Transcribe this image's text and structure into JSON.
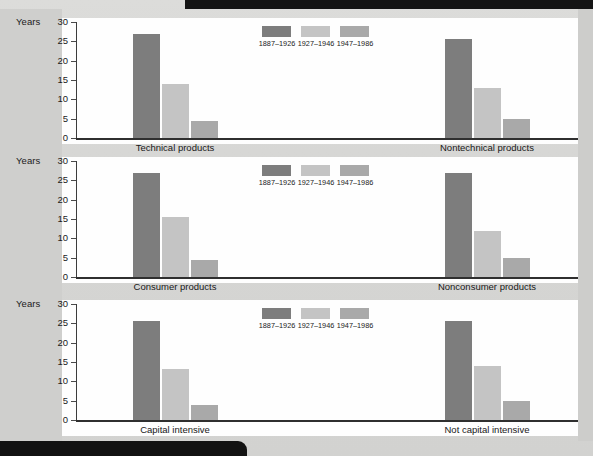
{
  "axis": {
    "y_label": "Years",
    "ticks": [
      "30",
      "25",
      "20",
      "15",
      "10",
      "5",
      "0"
    ],
    "ymin": 0,
    "ymax": 30
  },
  "legend": {
    "items": [
      {
        "label": "1887–1926",
        "color": "#7d7d7d"
      },
      {
        "label": "1927–1946",
        "color": "#c4c4c4"
      },
      {
        "label": "1947–1986",
        "color": "#a9a9a9"
      }
    ]
  },
  "chart_data": {
    "type": "bar",
    "title": "",
    "xlabel": "",
    "ylabel": "Years",
    "ylim": [
      0,
      30
    ],
    "grid": false,
    "legend_position": "top-center",
    "series": [
      {
        "name": "1887–1926",
        "color": "#7d7d7d"
      },
      {
        "name": "1927–1946",
        "color": "#c4c4c4"
      },
      {
        "name": "1947–1986",
        "color": "#a9a9a9"
      }
    ],
    "categories": [
      "Technical products",
      "Nontechnical products",
      "Consumer products",
      "Nonconsumer products",
      "Capital intensive",
      "Not capital intensive"
    ],
    "panels": [
      {
        "index": 0,
        "groups": [
          {
            "label": "Technical products",
            "values": [
              27,
              14,
              4.5
            ]
          },
          {
            "label": "Nontechnical products",
            "values": [
              25.5,
              13,
              5
            ]
          }
        ]
      },
      {
        "index": 1,
        "groups": [
          {
            "label": "Consumer products",
            "values": [
              27,
              15.5,
              4.5
            ]
          },
          {
            "label": "Nonconsumer products",
            "values": [
              27,
              12,
              5
            ]
          }
        ]
      },
      {
        "index": 2,
        "groups": [
          {
            "label": "Capital intensive",
            "values": [
              25.5,
              13.3,
              4
            ]
          },
          {
            "label": "Not capital intensive",
            "values": [
              25.5,
              14,
              5
            ]
          }
        ]
      }
    ]
  }
}
